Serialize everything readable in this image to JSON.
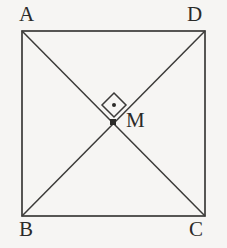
{
  "figure": {
    "kind": "square-with-diagonals",
    "caption": "",
    "colors": {
      "background": "#f6f5f3",
      "stroke": "#3b3a38",
      "label": "#2b2a28",
      "marker_fill": "#2b2a28"
    },
    "square": {
      "name": "ABCD",
      "left": 22,
      "top": 31,
      "right": 205,
      "bottom": 216,
      "stroke_width": 1.7
    },
    "vertices": [
      {
        "id": "A",
        "label": "A",
        "corner": "top-left",
        "x": 22,
        "y": 31
      },
      {
        "id": "D",
        "label": "D",
        "corner": "top-right",
        "x": 205,
        "y": 31
      },
      {
        "id": "B",
        "label": "B",
        "corner": "bottom-left",
        "x": 22,
        "y": 216
      },
      {
        "id": "C",
        "label": "C",
        "corner": "bottom-right",
        "x": 205,
        "y": 216
      }
    ],
    "diagonals": [
      {
        "id": "AC",
        "from": "A",
        "to": "C"
      },
      {
        "id": "BD",
        "from": "B",
        "to": "D"
      }
    ],
    "intersection": {
      "id": "M",
      "label": "M",
      "x": 113,
      "y": 122,
      "dot_size": 6,
      "right_angle_marker": {
        "shape": "diamond",
        "center_x": 114,
        "center_y": 105,
        "half_size": 12,
        "has_center_dot": true,
        "dot_radius": 2
      }
    }
  }
}
